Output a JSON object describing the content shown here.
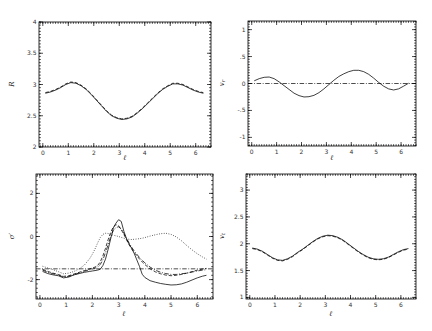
{
  "figure": {
    "background_color": "#ffffff",
    "line_color": "#000000",
    "tick_label_color": "#333333"
  },
  "chart_data": [
    {
      "type": "line",
      "title": "",
      "xlabel": "ℓ",
      "ylabel": "R",
      "ylabel_main": "R",
      "ylabel_sub": "",
      "xlim": [
        -0.15,
        6.6
      ],
      "ylim": [
        2,
        4
      ],
      "xticks": [
        0,
        1,
        2,
        3,
        4,
        5,
        6
      ],
      "xtick_labels": [
        "0",
        "1",
        "2",
        "3",
        "4",
        "5",
        "6"
      ],
      "xminor": 0.1,
      "yticks": [
        2,
        2.5,
        3,
        3.5,
        4
      ],
      "ytick_labels": [
        "2",
        "2.5",
        "3",
        "3.5",
        "4"
      ],
      "yminor": 0.05,
      "grid": false,
      "legend": null,
      "refline_y": null,
      "x": [
        0.1,
        0.3,
        0.5,
        0.7,
        0.9,
        1.1,
        1.3,
        1.5,
        1.7,
        1.9,
        2.1,
        2.3,
        2.5,
        2.7,
        2.9,
        3.1,
        3.3,
        3.5,
        3.7,
        3.9,
        4.1,
        4.3,
        4.5,
        4.7,
        4.9,
        5.1,
        5.3,
        5.5,
        5.7,
        5.9,
        6.1,
        6.3
      ],
      "series": [
        {
          "name": "R-solid",
          "style": "solid",
          "y": [
            2.86,
            2.88,
            2.91,
            2.95,
            3.0,
            3.03,
            3.02,
            2.98,
            2.92,
            2.84,
            2.75,
            2.66,
            2.57,
            2.5,
            2.46,
            2.44,
            2.45,
            2.48,
            2.54,
            2.61,
            2.69,
            2.77,
            2.85,
            2.92,
            2.97,
            3.01,
            3.01,
            2.99,
            2.95,
            2.91,
            2.88,
            2.86
          ]
        },
        {
          "name": "R-dashed",
          "style": "dashed",
          "y": [
            2.87,
            2.89,
            2.92,
            2.96,
            3.01,
            3.04,
            3.03,
            2.99,
            2.93,
            2.85,
            2.76,
            2.67,
            2.58,
            2.51,
            2.47,
            2.45,
            2.46,
            2.49,
            2.55,
            2.62,
            2.7,
            2.78,
            2.86,
            2.93,
            2.98,
            3.02,
            3.02,
            3.0,
            2.96,
            2.92,
            2.89,
            2.87
          ]
        }
      ]
    },
    {
      "type": "line",
      "title": "",
      "xlabel": "ℓ",
      "ylabel": "v_r",
      "ylabel_main": "v",
      "ylabel_sub": "r",
      "xlim": [
        -0.15,
        6.6
      ],
      "ylim": [
        -1.16,
        1.16
      ],
      "xticks": [
        0,
        1,
        2,
        3,
        4,
        5,
        6
      ],
      "xtick_labels": [
        "0",
        "1",
        "2",
        "3",
        "4",
        "5",
        "6"
      ],
      "xminor": 0.1,
      "yticks": [
        -1,
        -0.5,
        0,
        0.5,
        1
      ],
      "ytick_labels": [
        "-1",
        "-.5",
        "0",
        ".5",
        "1"
      ],
      "yminor": 0.05,
      "grid": false,
      "legend": null,
      "refline_y": 0,
      "x": [
        0.1,
        0.3,
        0.5,
        0.7,
        0.9,
        1.1,
        1.3,
        1.5,
        1.7,
        1.9,
        2.1,
        2.3,
        2.5,
        2.7,
        2.9,
        3.1,
        3.3,
        3.5,
        3.7,
        3.9,
        4.1,
        4.3,
        4.5,
        4.7,
        4.9,
        5.1,
        5.3,
        5.5,
        5.7,
        5.9,
        6.1,
        6.3
      ],
      "series": [
        {
          "name": "vr-solid",
          "style": "solid",
          "y": [
            0.05,
            0.09,
            0.115,
            0.12,
            0.09,
            0.03,
            -0.04,
            -0.11,
            -0.18,
            -0.225,
            -0.25,
            -0.245,
            -0.22,
            -0.17,
            -0.1,
            -0.02,
            0.06,
            0.13,
            0.18,
            0.22,
            0.245,
            0.245,
            0.22,
            0.17,
            0.1,
            0.02,
            -0.05,
            -0.1,
            -0.12,
            -0.1,
            -0.05,
            0.005
          ]
        }
      ]
    },
    {
      "type": "line",
      "title": "",
      "xlabel": "ℓ",
      "ylabel": "σ′",
      "ylabel_main": "σ′",
      "ylabel_sub": "",
      "xlim": [
        -0.15,
        6.6
      ],
      "ylim": [
        -2.9,
        2.9
      ],
      "xticks": [
        0,
        1,
        2,
        3,
        4,
        5,
        6
      ],
      "xtick_labels": [
        "0",
        "1",
        "2",
        "3",
        "4",
        "5",
        "6"
      ],
      "xminor": 0.1,
      "yticks": [
        -2,
        0,
        2
      ],
      "ytick_labels": [
        "-2",
        "0",
        "2"
      ],
      "yminor": 0.2,
      "grid": false,
      "legend": null,
      "refline_y": -1.5,
      "x": [
        0.1,
        0.3,
        0.5,
        0.7,
        0.9,
        1.1,
        1.3,
        1.5,
        1.7,
        1.9,
        2.0,
        2.1,
        2.2,
        2.3,
        2.4,
        2.5,
        2.6,
        2.7,
        2.8,
        2.9,
        3.0,
        3.1,
        3.2,
        3.3,
        3.4,
        3.5,
        3.6,
        3.8,
        3.9,
        4.0,
        4.2,
        4.4,
        4.6,
        4.8,
        5.0,
        5.2,
        5.4,
        5.6,
        5.8,
        6.0,
        6.2,
        6.35
      ],
      "series": [
        {
          "name": "sigma-solid",
          "style": "solid",
          "y": [
            -1.62,
            -1.72,
            -1.78,
            -1.82,
            -1.92,
            -1.88,
            -1.78,
            -1.72,
            -1.66,
            -1.62,
            -1.6,
            -1.58,
            -1.56,
            -1.52,
            -1.35,
            -1.05,
            -0.6,
            -0.1,
            0.4,
            0.62,
            0.78,
            0.7,
            0.25,
            -0.1,
            -0.35,
            -0.55,
            -0.8,
            -1.4,
            -1.75,
            -1.9,
            -2.05,
            -2.12,
            -2.18,
            -2.22,
            -2.25,
            -2.24,
            -2.2,
            -2.12,
            -2.02,
            -1.92,
            -1.84,
            -1.8
          ]
        },
        {
          "name": "sigma-dashed",
          "style": "dashed",
          "y": [
            -1.52,
            -1.62,
            -1.7,
            -1.76,
            -1.85,
            -1.82,
            -1.74,
            -1.66,
            -1.58,
            -1.5,
            -1.46,
            -1.42,
            -1.35,
            -1.18,
            -0.9,
            -0.55,
            -0.15,
            0.2,
            0.45,
            0.55,
            0.5,
            0.32,
            0.1,
            -0.15,
            -0.38,
            -0.58,
            -0.75,
            -1.05,
            -1.18,
            -1.3,
            -1.5,
            -1.64,
            -1.73,
            -1.79,
            -1.82,
            -1.8,
            -1.76,
            -1.7,
            -1.63,
            -1.56,
            -1.51,
            -1.48
          ]
        },
        {
          "name": "sigma-dashdot",
          "style": "dashdot",
          "y": [
            -1.56,
            -1.66,
            -1.73,
            -1.79,
            -1.88,
            -1.85,
            -1.77,
            -1.69,
            -1.61,
            -1.54,
            -1.51,
            -1.47,
            -1.42,
            -1.3,
            -1.08,
            -0.75,
            -0.38,
            0.0,
            0.28,
            0.42,
            0.45,
            0.35,
            0.15,
            -0.08,
            -0.3,
            -0.5,
            -0.68,
            -0.98,
            -1.1,
            -1.22,
            -1.42,
            -1.56,
            -1.66,
            -1.72,
            -1.76,
            -1.76,
            -1.73,
            -1.7,
            -1.65,
            -1.6,
            -1.56,
            -1.54
          ]
        },
        {
          "name": "sigma-dotted",
          "style": "dotted",
          "y": [
            -1.38,
            -1.46,
            -1.54,
            -1.63,
            -1.73,
            -1.7,
            -1.62,
            -1.5,
            -1.32,
            -1.02,
            -0.82,
            -0.58,
            -0.3,
            -0.05,
            0.1,
            0.15,
            0.14,
            0.1,
            0.06,
            0.03,
            0.0,
            -0.04,
            -0.08,
            -0.11,
            -0.13,
            -0.14,
            -0.13,
            -0.1,
            -0.08,
            -0.05,
            0.02,
            0.08,
            0.13,
            0.15,
            0.1,
            -0.02,
            -0.2,
            -0.42,
            -0.62,
            -0.8,
            -0.95,
            -1.05
          ]
        }
      ]
    },
    {
      "type": "line",
      "title": "",
      "xlabel": "ℓ",
      "ylabel": "v_t",
      "ylabel_main": "v",
      "ylabel_sub": "t",
      "xlim": [
        -0.15,
        6.6
      ],
      "ylim": [
        0.97,
        3.3
      ],
      "xticks": [
        0,
        1,
        2,
        3,
        4,
        5,
        6
      ],
      "xtick_labels": [
        "0",
        "1",
        "2",
        "3",
        "4",
        "5",
        "6"
      ],
      "xminor": 0.1,
      "yticks": [
        1,
        1.5,
        2,
        2.5,
        3
      ],
      "ytick_labels": [
        "1",
        "1.5",
        "2",
        "2.5",
        "3"
      ],
      "yminor": 0.05,
      "grid": false,
      "legend": null,
      "refline_y": null,
      "x": [
        0.1,
        0.3,
        0.5,
        0.7,
        0.9,
        1.1,
        1.3,
        1.5,
        1.7,
        1.9,
        2.1,
        2.3,
        2.5,
        2.7,
        2.9,
        3.1,
        3.3,
        3.5,
        3.7,
        3.9,
        4.1,
        4.3,
        4.5,
        4.7,
        4.9,
        5.1,
        5.3,
        5.5,
        5.7,
        5.9,
        6.1,
        6.3
      ],
      "series": [
        {
          "name": "vt-solid",
          "style": "solid",
          "y": [
            1.92,
            1.9,
            1.86,
            1.8,
            1.74,
            1.7,
            1.69,
            1.72,
            1.77,
            1.84,
            1.9,
            1.97,
            2.04,
            2.1,
            2.14,
            2.16,
            2.15,
            2.12,
            2.07,
            2.0,
            1.93,
            1.86,
            1.8,
            1.75,
            1.72,
            1.71,
            1.72,
            1.75,
            1.8,
            1.85,
            1.89,
            1.91
          ]
        },
        {
          "name": "vt-dashed",
          "style": "dashed",
          "y": [
            1.91,
            1.89,
            1.85,
            1.79,
            1.73,
            1.69,
            1.68,
            1.71,
            1.76,
            1.83,
            1.89,
            1.96,
            2.03,
            2.09,
            2.13,
            2.15,
            2.14,
            2.11,
            2.06,
            1.99,
            1.92,
            1.85,
            1.79,
            1.74,
            1.71,
            1.7,
            1.71,
            1.74,
            1.79,
            1.84,
            1.88,
            1.9
          ]
        }
      ]
    }
  ]
}
